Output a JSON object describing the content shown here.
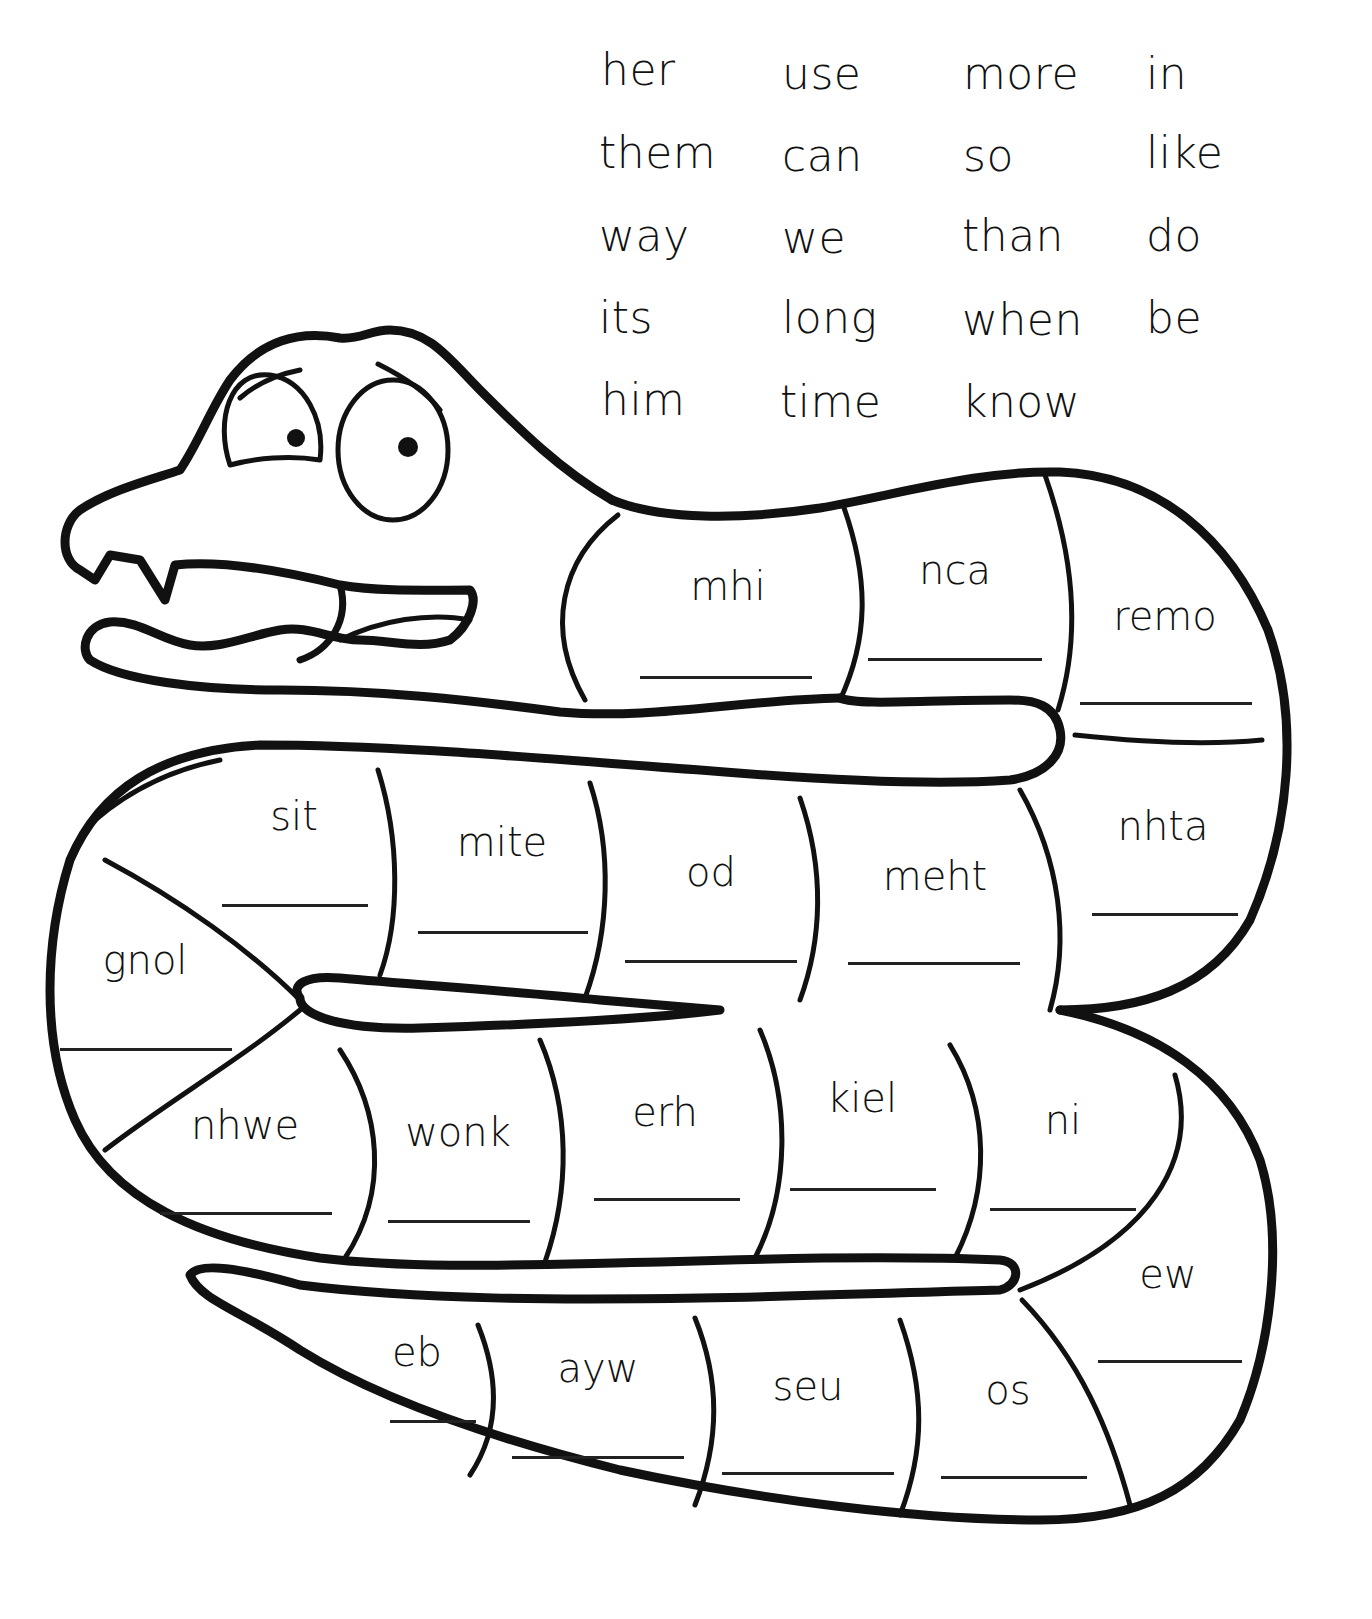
{
  "worksheet": {
    "type": "unscramble-words",
    "character": "snake"
  },
  "word_bank": {
    "columns": [
      [
        "her",
        "them",
        "way",
        "its",
        "him"
      ],
      [
        "use",
        "can",
        "we",
        "long",
        "time"
      ],
      [
        "more",
        "so",
        "than",
        "when",
        "know"
      ],
      [
        "in",
        "like",
        "do",
        "be"
      ]
    ]
  },
  "segments": [
    {
      "scrambled": "mhi",
      "answer": ""
    },
    {
      "scrambled": "nca",
      "answer": ""
    },
    {
      "scrambled": "remo",
      "answer": ""
    },
    {
      "scrambled": "sit",
      "answer": ""
    },
    {
      "scrambled": "mite",
      "answer": ""
    },
    {
      "scrambled": "od",
      "answer": ""
    },
    {
      "scrambled": "meht",
      "answer": ""
    },
    {
      "scrambled": "nhta",
      "answer": ""
    },
    {
      "scrambled": "gnol",
      "answer": ""
    },
    {
      "scrambled": "nhwe",
      "answer": ""
    },
    {
      "scrambled": "wonk",
      "answer": ""
    },
    {
      "scrambled": "erh",
      "answer": ""
    },
    {
      "scrambled": "kiel",
      "answer": ""
    },
    {
      "scrambled": "ni",
      "answer": ""
    },
    {
      "scrambled": "ew",
      "answer": ""
    },
    {
      "scrambled": "eb",
      "answer": ""
    },
    {
      "scrambled": "ayw",
      "answer": ""
    },
    {
      "scrambled": "seu",
      "answer": ""
    },
    {
      "scrambled": "os",
      "answer": ""
    }
  ],
  "colors": {
    "ink": "#111111",
    "paper": "#ffffff"
  }
}
